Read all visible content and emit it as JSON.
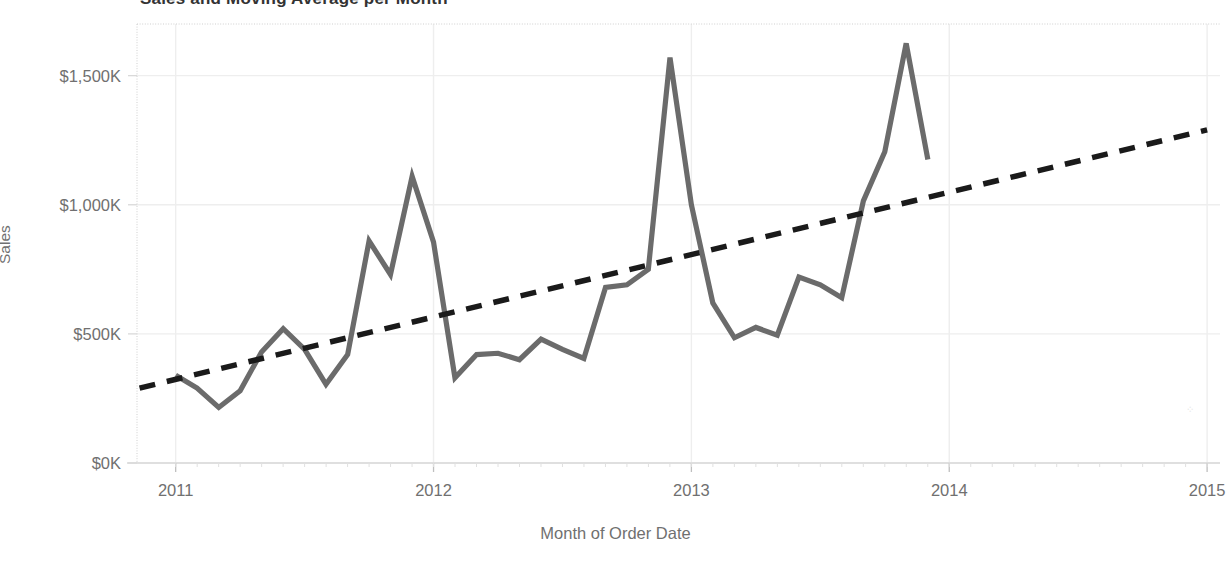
{
  "chart": {
    "title": "Sales and Moving Average per Month",
    "axis_title_y": "Sales",
    "axis_title_x": "Month of Order Date",
    "artifact_glyph": "⁘"
  },
  "colors": {
    "line": "#6b6b6b",
    "trend": "#1a1a1a",
    "grid": "#eeeeee",
    "axis": "#d9d9d9",
    "text": "#707070",
    "title": "#333333",
    "background": "#ffffff"
  },
  "chart_data": {
    "type": "line",
    "title": "Sales and Moving Average per Month",
    "xlabel": "Month of Order Date",
    "ylabel": "Sales",
    "grid": true,
    "legend": "none",
    "xlim": [
      2010.85,
      2015.05
    ],
    "ylim": [
      0,
      1700
    ],
    "y_ticks": [
      0,
      500,
      1000,
      1500
    ],
    "y_tick_labels": [
      "$0K",
      "$500K",
      "$1,000K",
      "$1,500K"
    ],
    "x_ticks": [
      2011,
      2012,
      2013,
      2014,
      2015
    ],
    "x_tick_labels": [
      "2011",
      "2012",
      "2013",
      "2014",
      "2015"
    ],
    "y_unit": "thousands of dollars",
    "series": [
      {
        "name": "Sales",
        "style": "solid",
        "color": "#6b6b6b",
        "x": [
          2011.0,
          2011.083,
          2011.167,
          2011.25,
          2011.333,
          2011.417,
          2011.5,
          2011.583,
          2011.667,
          2011.75,
          2011.833,
          2011.917,
          2012.0,
          2012.083,
          2012.167,
          2012.25,
          2012.333,
          2012.417,
          2012.5,
          2012.583,
          2012.667,
          2012.75,
          2012.833,
          2012.917,
          2013.0,
          2013.083,
          2013.167,
          2013.25,
          2013.333,
          2013.417,
          2013.5,
          2013.583,
          2013.667,
          2013.75,
          2013.833,
          2013.917
        ],
        "x_labels": [
          "Jan 2011",
          "Feb 2011",
          "Mar 2011",
          "Apr 2011",
          "May 2011",
          "Jun 2011",
          "Jul 2011",
          "Aug 2011",
          "Sep 2011",
          "Oct 2011",
          "Nov 2011",
          "Dec 2011",
          "Jan 2012",
          "Feb 2012",
          "Mar 2012",
          "Apr 2012",
          "May 2012",
          "Jun 2012",
          "Jul 2012",
          "Aug 2012",
          "Sep 2012",
          "Oct 2012",
          "Nov 2012",
          "Dec 2012",
          "Jan 2013",
          "Feb 2013",
          "Mar 2013",
          "Apr 2013",
          "May 2013",
          "Jun 2013",
          "Jul 2013",
          "Aug 2013",
          "Sep 2013",
          "Oct 2013",
          "Nov 2013",
          "Dec 2013"
        ],
        "values": [
          340,
          290,
          215,
          280,
          430,
          520,
          440,
          305,
          420,
          860,
          730,
          1110,
          855,
          330,
          420,
          425,
          400,
          480,
          440,
          405,
          680,
          690,
          750,
          1570,
          1000,
          620,
          485,
          525,
          495,
          720,
          690,
          640,
          1015,
          1205,
          1625,
          1175
        ]
      },
      {
        "name": "Trend / Moving Average",
        "style": "dashed",
        "color": "#1a1a1a",
        "x": [
          2010.86,
          2015.0
        ],
        "values": [
          290,
          1290
        ]
      }
    ]
  }
}
